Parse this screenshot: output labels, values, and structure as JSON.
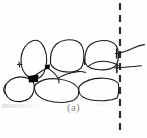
{
  "figure": {
    "caption": "(a)",
    "colors": {
      "background": "#fefefe",
      "stroke": "#1a1a1a",
      "fill_marker": "#000000",
      "caption_text": "#8a8a8a",
      "dash_line": "#2b2b2b"
    },
    "stroke_width": 1.1,
    "midline": {
      "label": "vertical-dashed-midline",
      "x": 120,
      "y_start": 3,
      "y_end": 135,
      "dash_length": 7,
      "dash_gap": 5,
      "width": 2.2
    },
    "contact_markers": [
      {
        "label": "marker-left-junction",
        "x": 34,
        "y": 78
      },
      {
        "label": "marker-upper-mid",
        "x": 47,
        "y": 67
      }
    ],
    "tick_lines": [
      {
        "label": "tick-upper-right",
        "x1": 116,
        "y1": 53,
        "x2": 145,
        "y2": 46
      },
      {
        "label": "tick-lower-right",
        "x1": 116,
        "y1": 68,
        "x2": 142,
        "y2": 66
      }
    ],
    "tooth_outlines": [
      {
        "label": "upper-tooth-1-left-oval"
      },
      {
        "label": "upper-tooth-2-center"
      },
      {
        "label": "upper-tooth-3-right"
      },
      {
        "label": "lower-tooth-1-left-round"
      },
      {
        "label": "lower-tooth-2-center"
      },
      {
        "label": "lower-tooth-3-right"
      }
    ]
  }
}
